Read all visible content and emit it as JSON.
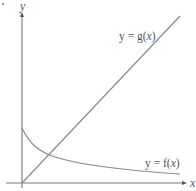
{
  "figure": {
    "type": "function-graph-diagram",
    "axes": {
      "x_label": "x",
      "y_label": "y",
      "color": "#777777"
    },
    "curves": [
      {
        "id": "g",
        "label_prefix": "y = g(",
        "label_var": "x",
        "label_suffix": ")",
        "description": "increasing straight line through origin",
        "color": "#8a8a8a"
      },
      {
        "id": "f",
        "label_prefix": "y = f(",
        "label_var": "x",
        "label_suffix": ")",
        "description": "decreasing curve with positive y-intercept, approaching x-axis",
        "color": "#8a8a8a"
      }
    ],
    "intersection": "curves g and f intersect once near the origin side"
  }
}
